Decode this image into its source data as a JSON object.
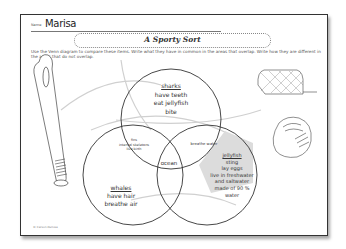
{
  "worksheet": {
    "name_label": "Name",
    "name_value": "Marisa",
    "title": "A Sporty Sort",
    "instructions": "Use the Venn diagram to compare these items. Write what they have in common in the areas that overlap. Write how they are different in the areas that do not overlap.",
    "copyright": "© Carson-Dellosa"
  },
  "venn": {
    "top_circle": {
      "heading": "sharks",
      "items": [
        "have teeth",
        "eat jellyfish",
        "bite"
      ]
    },
    "left_circle": {
      "heading": "whales",
      "items": [
        "have hair",
        "breathe air"
      ]
    },
    "right_circle": {
      "heading": "jellyfish",
      "items": [
        "sting",
        "lay eggs",
        "live in freshwater",
        "and saltwater",
        "made of 90 %",
        "water"
      ]
    },
    "overlap_top_left": [
      "fins",
      "internal skeletons",
      "live birth"
    ],
    "overlap_top_right": [
      "breathe water"
    ],
    "overlap_all": [
      "ocean"
    ]
  },
  "illustrations": [
    "baseball-bat",
    "soccer-goal",
    "baseball-glove",
    "ball-trail-lines"
  ],
  "colors": {
    "ink": "#333333",
    "border": "#333333",
    "shade": "#dddddd",
    "faint": "#cccccc"
  }
}
